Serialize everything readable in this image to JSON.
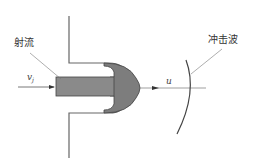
{
  "diagram": {
    "labels": {
      "jet": "射流",
      "shock_wave": "冲击波",
      "jet_velocity_symbol": "v",
      "jet_velocity_subscript": "j",
      "head_velocity_symbol": "u"
    },
    "colors": {
      "jet_fill": "#8a8a8a",
      "head_fill": "#7d7d7d",
      "line": "#555555",
      "wall": "#666666",
      "text": "#333333",
      "background": "#ffffff"
    }
  }
}
